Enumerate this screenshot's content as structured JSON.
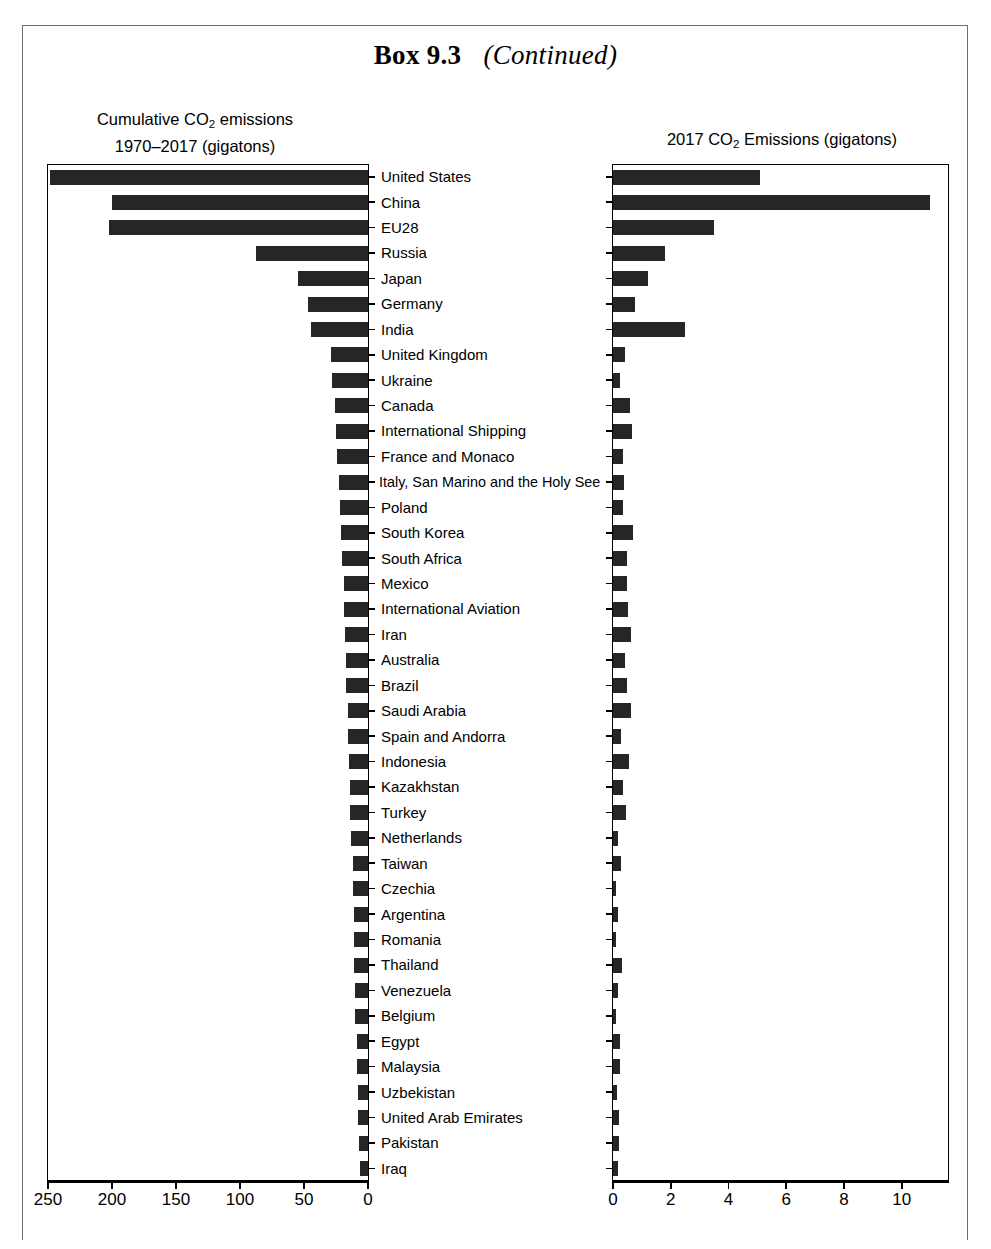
{
  "box": {
    "title_bold": "Box 9.3",
    "title_italic": "(Continued)"
  },
  "chart_data": {
    "type": "bar",
    "orientation": "horizontal",
    "panels": [
      {
        "id": "cumulative",
        "title_line1": "Cumulative CO2 emissions",
        "title_line2": "1970–2017 (gigatons)",
        "xlabel": "",
        "ylabel": "",
        "xlim": [
          250,
          0
        ],
        "reversed": true,
        "ticks": [
          250,
          200,
          150,
          100,
          50,
          0
        ],
        "tick_labels": [
          "250",
          "200",
          "150",
          "100",
          "50",
          "0"
        ],
        "grid": false
      },
      {
        "id": "annual2017",
        "title_line1": "2017 CO2 Emissions (gigatons)",
        "title_line2": "",
        "xlabel": "",
        "ylabel": "",
        "xlim": [
          0,
          11.6
        ],
        "reversed": false,
        "ticks": [
          0,
          2,
          4,
          6,
          8,
          10
        ],
        "tick_labels": [
          "0",
          "2",
          "4",
          "6",
          "8",
          "10"
        ],
        "grid": false
      }
    ],
    "categories": [
      "United States",
      "China",
      "EU28",
      "Russia",
      "Japan",
      "Germany",
      "India",
      "United Kingdom",
      "Ukraine",
      "Canada",
      "International Shipping",
      "France and Monaco",
      "Italy, San Marino and the Holy See",
      "Poland",
      "South Korea",
      "South Africa",
      "Mexico",
      "International Aviation",
      "Iran",
      "Australia",
      "Brazil",
      "Saudi Arabia",
      "Spain and Andorra",
      "Indonesia",
      "Kazakhstan",
      "Turkey",
      "Netherlands",
      "Taiwan",
      "Czechia",
      "Argentina",
      "Romania",
      "Thailand",
      "Venezuela",
      "Belgium",
      "Egypt",
      "Malaysia",
      "Uzbekistan",
      "United Arab Emirates",
      "Pakistan",
      "Iraq"
    ],
    "series": [
      {
        "name": "Cumulative CO2 emissions 1970–2017 (gigatons)",
        "panel": "cumulative",
        "units": "gigatons",
        "values": [
          249,
          201,
          203,
          88,
          55,
          47,
          45,
          29,
          28,
          26,
          25,
          24,
          23,
          22,
          21,
          20,
          19,
          19,
          18,
          17,
          17,
          16,
          16,
          15,
          14,
          14,
          13,
          12,
          12,
          11,
          11,
          11,
          10,
          10,
          9,
          9,
          8,
          8,
          7,
          6
        ]
      },
      {
        "name": "2017 CO2 Emissions (gigatons)",
        "panel": "annual2017",
        "units": "gigatons",
        "values": [
          5.1,
          11.0,
          3.5,
          1.8,
          1.2,
          0.75,
          2.5,
          0.4,
          0.24,
          0.58,
          0.65,
          0.36,
          0.37,
          0.33,
          0.68,
          0.47,
          0.5,
          0.52,
          0.62,
          0.42,
          0.48,
          0.64,
          0.29,
          0.54,
          0.33,
          0.45,
          0.19,
          0.28,
          0.12,
          0.19,
          0.09,
          0.3,
          0.17,
          0.12,
          0.25,
          0.25,
          0.13,
          0.22,
          0.2,
          0.19
        ]
      }
    ],
    "legend": null,
    "legend_position": "none"
  }
}
